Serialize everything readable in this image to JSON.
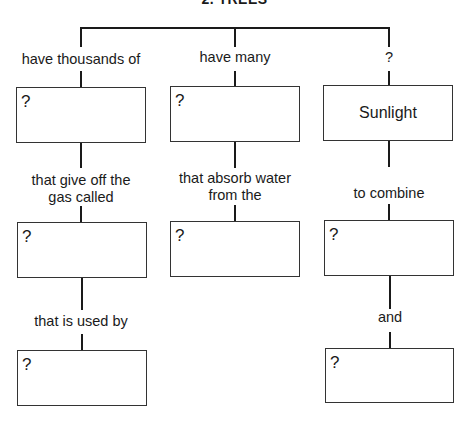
{
  "title": "2. TREES",
  "top_labels": {
    "left": "have thousands of",
    "middle": "have many",
    "right": "?"
  },
  "columns": {
    "left": {
      "box1": "?",
      "connector1": [
        "that give off the",
        "gas called"
      ],
      "box2": "?",
      "connector2": "that is used by",
      "box3": "?"
    },
    "middle": {
      "box1": "?",
      "connector1": [
        "that absorb water",
        "from the"
      ],
      "box2": "?"
    },
    "right": {
      "box1": "Sunlight",
      "connector1": "to combine",
      "box2": "?",
      "connector2": "and",
      "box3": "?"
    }
  },
  "colors": {
    "line": "#1a1a1a",
    "box_border": "#333333",
    "background": "#ffffff"
  }
}
